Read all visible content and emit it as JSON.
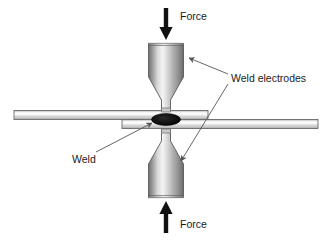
{
  "figure": {
    "background_color": "#ffffff"
  },
  "labels": {
    "force_top": "Force",
    "force_bottom": "Force",
    "weld_electrodes": "Weld electrodes",
    "weld": "Weld"
  },
  "colors": {
    "electrode_light": "#f2f2f2",
    "electrode_mid": "#b8b8b8",
    "electrode_dark": "#7a7a7a",
    "electrode_edge": "#5f5f5f",
    "sheet_light": "#f7f7f7",
    "sheet_mid": "#d6d6d6",
    "sheet_edge": "#6b6b6b",
    "weld_nugget": "#111111",
    "arrow": "#111111",
    "leader_line": "#555555",
    "text": "#1a1a1a"
  },
  "parts": {
    "top_electrode": "top-electrode",
    "bottom_electrode": "bottom-electrode",
    "upper_sheet": "upper-workpiece-sheet",
    "lower_sheet": "lower-workpiece-sheet",
    "weld_nugget": "weld-nugget"
  }
}
